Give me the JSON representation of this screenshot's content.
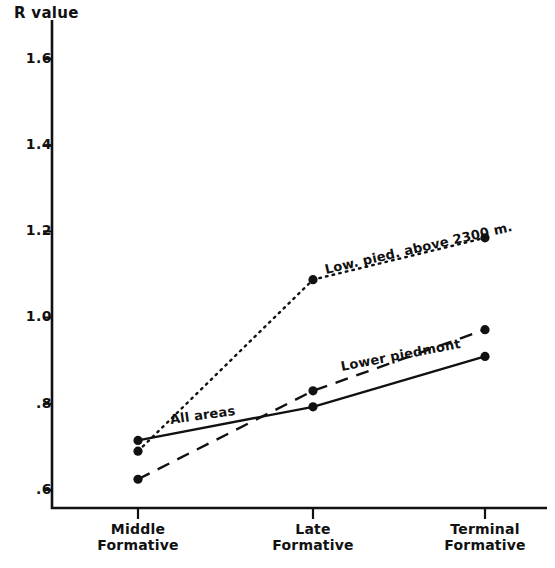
{
  "chart_data": {
    "type": "line",
    "title": "",
    "ylabel": "R value",
    "xlabel": "",
    "categories": [
      "Middle Formative",
      "Late Formative",
      "Terminal Formative"
    ],
    "x_tick_lines": [
      [
        "Middle",
        "Formative"
      ],
      [
        "Late",
        "Formative"
      ],
      [
        "Terminal",
        "Formative"
      ]
    ],
    "ylim": [
      0.53,
      1.68
    ],
    "yticks": [
      1.6,
      1.4,
      1.2,
      1.0,
      0.8,
      0.6
    ],
    "ytick_labels": [
      "1.6",
      "1.4",
      "1.2",
      "1.0",
      ".8",
      ".6"
    ],
    "grid": false,
    "legend": "inline-annotations",
    "series": [
      {
        "name": "All areas",
        "style": "solid",
        "values": [
          0.715,
          0.793,
          0.91
        ],
        "annotation": "All   areas"
      },
      {
        "name": "Lower piedmont",
        "style": "dashed",
        "values": [
          0.625,
          0.83,
          0.972
        ],
        "annotation": "Lower piedmont"
      },
      {
        "name": "Low. pied. above 2300 m.",
        "style": "dotted",
        "values": [
          0.69,
          1.088,
          1.185
        ],
        "annotation": "Low. pied. above  2300 m."
      }
    ],
    "marker": "filled-circle",
    "colors": {
      "ink": "#111111",
      "background": "#ffffff"
    }
  },
  "annotations": {
    "all_areas": "All   areas",
    "lower_piedmont": "Lower piedmont",
    "low_pied_above": "Low. pied. above  2300 m."
  },
  "axis": {
    "y_title": "R value"
  }
}
